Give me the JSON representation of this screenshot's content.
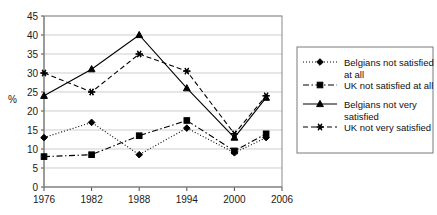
{
  "chart_data": {
    "type": "line",
    "title": "",
    "xlabel": "",
    "ylabel": "%",
    "x": [
      1976,
      1982,
      1988,
      1994,
      2000,
      2004
    ],
    "xticks": [
      "1976",
      "1982",
      "1988",
      "1994",
      "2000",
      "2006"
    ],
    "xtick_values": [
      1976,
      1982,
      1988,
      1994,
      2000,
      2006
    ],
    "xlim": [
      1976,
      2006
    ],
    "ylim": [
      0,
      45
    ],
    "yticks": [
      0,
      5,
      10,
      15,
      20,
      25,
      30,
      35,
      40,
      45
    ],
    "ytick_labels": [
      "0",
      "5",
      "10",
      "15",
      "20",
      "25",
      "30",
      "35",
      "40",
      "45"
    ],
    "grid": true,
    "legend_position": "right",
    "series": [
      {
        "name": "Belgians not satisfied at all",
        "marker": "diamond",
        "linestyle": "dotted",
        "color": "#000000",
        "values": [
          13,
          17,
          8.5,
          15.5,
          9,
          13
        ]
      },
      {
        "name": "UK not satisfied at all",
        "marker": "square",
        "linestyle": "dashdot",
        "color": "#000000",
        "values": [
          8,
          8.5,
          13.5,
          17.5,
          9.5,
          14
        ]
      },
      {
        "name": "Belgians not very satisfied",
        "marker": "triangle",
        "linestyle": "solid",
        "color": "#000000",
        "values": [
          24,
          31,
          40,
          26,
          13,
          23.5
        ]
      },
      {
        "name": "UK not very satisfied",
        "marker": "asterisk",
        "linestyle": "dashed",
        "color": "#000000",
        "values": [
          30,
          25,
          35,
          30.5,
          14,
          24
        ]
      }
    ]
  },
  "legend": {
    "entries": [
      {
        "label": "Belgians not satisfied at all"
      },
      {
        "label": "UK not satisfied at all"
      },
      {
        "label": "Belgians not very satisfied"
      },
      {
        "label": "UK not very satisfied"
      }
    ]
  }
}
